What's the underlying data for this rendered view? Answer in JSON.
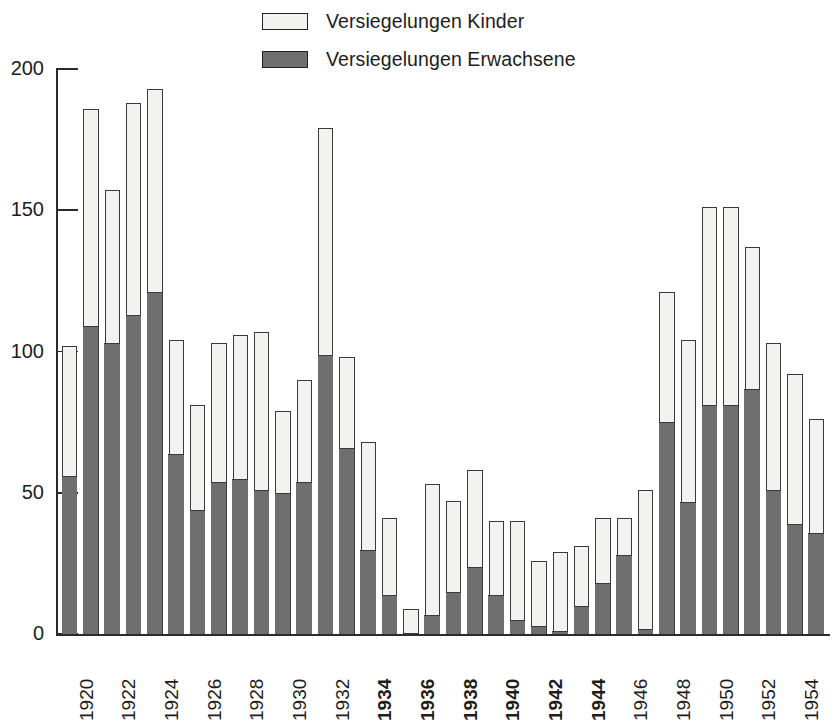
{
  "legend": {
    "position": "top-center",
    "items": [
      {
        "label": "Versiegelungen Kinder",
        "swatch": "light",
        "color": "#f2f2f0"
      },
      {
        "label": "Versiegelungen Erwachsene",
        "swatch": "dark",
        "color": "#6f6f6f"
      }
    ]
  },
  "axes": {
    "y_ticks": [
      "0",
      "50",
      "100",
      "150",
      "200"
    ],
    "y_tick_values": [
      0,
      50,
      100,
      150,
      200
    ],
    "ylabel": "",
    "xlabel": ""
  },
  "chart_data": {
    "type": "bar",
    "stacked": true,
    "title": "",
    "subtitle": "",
    "xlabel": "",
    "ylabel": "",
    "ylim": [
      0,
      200
    ],
    "yticks": [
      0,
      50,
      100,
      150,
      200
    ],
    "grid": false,
    "legend_position": "top-center",
    "x_tick_label_interval": 2,
    "bold_tick_labels": [
      "1934",
      "1936",
      "1938",
      "1940",
      "1942",
      "1944"
    ],
    "categories": [
      "1920",
      "1921",
      "1922",
      "1923",
      "1924",
      "1925",
      "1926",
      "1927",
      "1928",
      "1929",
      "1930",
      "1931",
      "1932",
      "1933",
      "1934",
      "1935",
      "1936",
      "1937",
      "1938",
      "1939",
      "1940",
      "1941",
      "1942",
      "1943",
      "1944",
      "1945",
      "1946",
      "1947",
      "1948",
      "1949",
      "1950",
      "1951",
      "1952",
      "1953",
      "1954",
      "1955"
    ],
    "series": [
      {
        "name": "Versiegelungen Erwachsene",
        "color": "#6f6f6f",
        "values": [
          56,
          109,
          103,
          113,
          121,
          64,
          44,
          54,
          55,
          51,
          50,
          54,
          99,
          66,
          30,
          14,
          0,
          7,
          15,
          24,
          14,
          5,
          3,
          1,
          10,
          18,
          28,
          2,
          75,
          47,
          81,
          81,
          87,
          51,
          39,
          36
        ]
      },
      {
        "name": "Versiegelungen Kinder",
        "color": "#f2f2f0",
        "values": [
          46,
          77,
          54,
          75,
          72,
          40,
          37,
          49,
          51,
          56,
          29,
          36,
          80,
          32,
          38,
          27,
          9,
          46,
          32,
          34,
          26,
          35,
          23,
          28,
          21,
          23,
          13,
          49,
          46,
          57,
          70,
          70,
          50,
          52,
          53,
          40
        ]
      }
    ],
    "totals": [
      102,
      186,
      157,
      188,
      193,
      104,
      81,
      103,
      106,
      107,
      79,
      90,
      179,
      98,
      68,
      41,
      9,
      53,
      47,
      58,
      40,
      40,
      26,
      29,
      31,
      41,
      41,
      51,
      121,
      104,
      151,
      151,
      137,
      103,
      92,
      76
    ]
  }
}
